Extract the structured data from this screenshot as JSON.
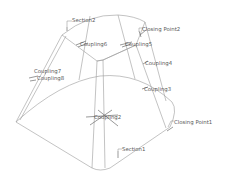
{
  "diagram": {
    "type": "CAD loft preview",
    "colors": {
      "background": "#ffffff",
      "edges": "#9a9a9a",
      "labels": "#5a5a5a"
    },
    "labels": {
      "section1": "Section1",
      "section2": "Section2",
      "closing_point1": "Closing Point1",
      "closing_point2": "Closing Point2",
      "coupling2": "Coupling2",
      "coupling3": "Coupling3",
      "coupling4": "Coupling4",
      "coupling5": "Coupling5",
      "coupling6": "Coupling6",
      "coupling7": "Coupling7",
      "coupling8": "Coupling8"
    }
  }
}
